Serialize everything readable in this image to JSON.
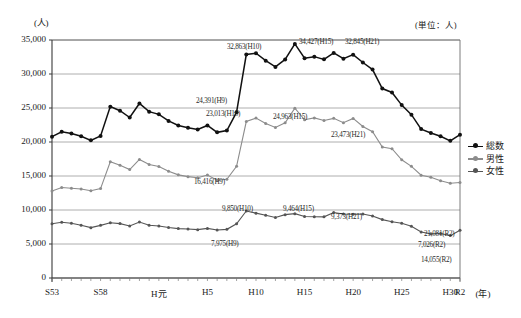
{
  "axes": {
    "y_unit_label": "(人)",
    "unit_note": "(単位：人)",
    "y_ticks": [
      "35,000",
      "30,000",
      "25,000",
      "20,000",
      "15,000",
      "10,000",
      "5,000",
      "0"
    ],
    "x_ticks": [
      "S53",
      "S58",
      "H元",
      "H5",
      "H10",
      "H15",
      "H20",
      "H25",
      "H30",
      "R2"
    ],
    "x_axis_unit": "(年)"
  },
  "legend": {
    "items": [
      {
        "label": "総数",
        "color": "#111111"
      },
      {
        "label": "男性",
        "color": "#8c8c8c"
      },
      {
        "label": "女性",
        "color": "#555555"
      }
    ]
  },
  "annotations": [
    {
      "text": "32,863(H10)",
      "x": 227,
      "y": 43,
      "series": "総数"
    },
    {
      "text": "34,427(H15)",
      "x": 299,
      "y": 38,
      "series": "総数"
    },
    {
      "text": "32,845(H21)",
      "x": 345,
      "y": 38,
      "series": "総数"
    },
    {
      "text": "24,391(H9)",
      "x": 196,
      "y": 97,
      "series": "総数"
    },
    {
      "text": "21,081(R2)",
      "x": 424,
      "y": 230,
      "series": "総数"
    },
    {
      "text": "23,013(H10)",
      "x": 206,
      "y": 110,
      "series": "男性"
    },
    {
      "text": "24,963(H15)",
      "x": 273,
      "y": 113,
      "series": "男性"
    },
    {
      "text": "23,473(H21)",
      "x": 331,
      "y": 131,
      "series": "男性"
    },
    {
      "text": "16,416(H9)",
      "x": 194,
      "y": 178,
      "series": "男性"
    },
    {
      "text": "14,055(R2)",
      "x": 421,
      "y": 256,
      "series": "男性"
    },
    {
      "text": "9,850(H10)",
      "x": 222,
      "y": 205,
      "series": "女性"
    },
    {
      "text": "9,464(H15)",
      "x": 283,
      "y": 205,
      "series": "女性"
    },
    {
      "text": "9,373(H21)",
      "x": 331,
      "y": 213,
      "series": "女性"
    },
    {
      "text": "7,975(H9)",
      "x": 211,
      "y": 240,
      "series": "女性"
    },
    {
      "text": "7,026(R2)",
      "x": 418,
      "y": 241,
      "series": "女性"
    }
  ],
  "chart_data": {
    "type": "line",
    "title": "",
    "xlabel": "(年)",
    "ylabel": "(人)",
    "ylim": [
      0,
      35000
    ],
    "ytick_step": 5000,
    "grid": true,
    "legend_position": "right",
    "x": [
      "S53",
      "S54",
      "S55",
      "S56",
      "S57",
      "S58",
      "S59",
      "S60",
      "S61",
      "S62",
      "S63",
      "H元",
      "H2",
      "H3",
      "H4",
      "H5",
      "H6",
      "H7",
      "H8",
      "H9",
      "H10",
      "H11",
      "H12",
      "H13",
      "H14",
      "H15",
      "H16",
      "H17",
      "H18",
      "H19",
      "H20",
      "H21",
      "H22",
      "H23",
      "H24",
      "H25",
      "H26",
      "H27",
      "H28",
      "H29",
      "H30",
      "R元",
      "R2"
    ],
    "series": [
      {
        "name": "総数",
        "color": "#111111",
        "values": [
          20788,
          21503,
          21248,
          20836,
          20242,
          20893,
          25202,
          24596,
          23599,
          25667,
          24460,
          24066,
          23104,
          22436,
          22104,
          21851,
          22436,
          21420,
          21679,
          24391,
          32863,
          33048,
          31957,
          31042,
          32143,
          34427,
          32325,
          32552,
          32155,
          33093,
          32249,
          32845,
          31690,
          30651,
          27858,
          27283,
          25427,
          24025,
          21897,
          21321,
          20840,
          20169,
          21081
        ]
      },
      {
        "name": "男性",
        "color": "#8c8c8c",
        "values": [
          12807,
          13311,
          13188,
          13087,
          12838,
          13149,
          17085,
          16596,
          15950,
          17430,
          16697,
          16412,
          15688,
          15168,
          14906,
          14741,
          15142,
          14372,
          14525,
          16416,
          23013,
          23512,
          22727,
          22144,
          22828,
          24963,
          23272,
          23540,
          23161,
          23478,
          22831,
          23473,
          22283,
          21520,
          19273,
          19017,
          17386,
          16423,
          15121,
          14826,
          14290,
          13937,
          14055
        ]
      },
      {
        "name": "女性",
        "color": "#555555",
        "values": [
          7981,
          8192,
          8060,
          7749,
          7404,
          7744,
          8117,
          8000,
          7649,
          8237,
          7763,
          7654,
          7416,
          7268,
          7198,
          7110,
          7294,
          7048,
          7154,
          7975,
          9850,
          9536,
          9230,
          8898,
          9315,
          9464,
          9053,
          9012,
          8994,
          9615,
          9418,
          9373,
          9407,
          9131,
          8585,
          8266,
          8041,
          7602,
          6776,
          6495,
          6550,
          6232,
          7026
        ]
      }
    ]
  }
}
